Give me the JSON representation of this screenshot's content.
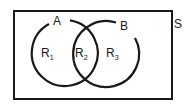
{
  "diagram": {
    "type": "venn",
    "universe_label": "S",
    "sets": [
      {
        "label": "A"
      },
      {
        "label": "B"
      }
    ],
    "regions": [
      {
        "letter": "R",
        "index": "1"
      },
      {
        "letter": "R",
        "index": "2"
      },
      {
        "letter": "R",
        "index": "3"
      }
    ],
    "colors": {
      "stroke": "#1a1a1a",
      "background": "#ffffff"
    }
  }
}
